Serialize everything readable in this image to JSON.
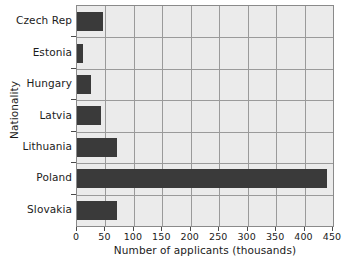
{
  "chart_data": {
    "type": "bar",
    "orientation": "horizontal",
    "title": "",
    "xlabel": "Number of applicants (thousands)",
    "ylabel": "Nationality",
    "categories": [
      "Czech Rep",
      "Estonia",
      "Hungary",
      "Latvia",
      "Lithuania",
      "Poland",
      "Slovakia"
    ],
    "values": [
      45,
      11,
      24,
      42,
      70,
      440,
      70
    ],
    "xlim": [
      0,
      450
    ],
    "xticks": [
      0,
      50,
      100,
      150,
      200,
      250,
      300,
      350,
      400,
      450
    ],
    "xtick_labels": [
      "0",
      "50",
      "100",
      "150",
      "200",
      "250",
      "300",
      "350",
      "400",
      "450"
    ],
    "grid": true,
    "grid_axes": "both",
    "legend": "none",
    "bar_color": "#3a3a3a",
    "plot_background": "#ebebeb",
    "grid_color": "#9a9a9a",
    "axis_color": "#8a8a8a",
    "figure_background": "#ffffff"
  }
}
